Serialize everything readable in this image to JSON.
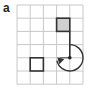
{
  "figure": {
    "panel_label": "a",
    "grid": {
      "columns": 5,
      "rows": 6,
      "origin_x": 17,
      "origin_y": 5,
      "cell_size": 13.2,
      "line_color": "#c8c8c8"
    },
    "shaded_cell": {
      "col": 3,
      "row": 1,
      "fill": "#cfcfcf",
      "stroke": "#333333"
    },
    "outlined_cell": {
      "col": 1,
      "row": 4,
      "stroke": "#333333"
    },
    "path_line": {
      "from": [
        4,
        2
      ],
      "to": [
        4,
        4
      ],
      "color": "#333333"
    },
    "pivot_dot": {
      "at": [
        4,
        4
      ],
      "color": "#222222"
    },
    "rotation_arrow": {
      "direction": "clockwise",
      "sweep_degrees": 270,
      "color": "#333333"
    },
    "colors": {
      "ink": "#333333",
      "grid": "#c8c8c8",
      "shade": "#cfcfcf"
    }
  }
}
